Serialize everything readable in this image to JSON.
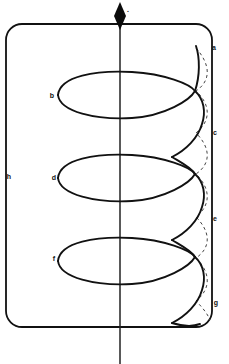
{
  "figure": {
    "background_color": "#ffffff",
    "line_color": "#111111",
    "dashed_line_color": "#444444",
    "canvas": {
      "width": 229,
      "height": 364
    }
  },
  "labels": {
    "a": "a",
    "b": "b",
    "c": "c",
    "d": "d",
    "e": "e",
    "f": "f",
    "g": "g",
    "h": "h",
    "apex": "."
  },
  "label_positions": {
    "a": {
      "x": 214,
      "y": 48
    },
    "b": {
      "x": 52,
      "y": 96
    },
    "c": {
      "x": 215,
      "y": 133
    },
    "d": {
      "x": 54,
      "y": 178
    },
    "e": {
      "x": 215,
      "y": 219
    },
    "f": {
      "x": 54,
      "y": 259
    },
    "g": {
      "x": 216,
      "y": 303
    },
    "h": {
      "x": 9,
      "y": 177
    },
    "apex": {
      "x": 128,
      "y": 10
    }
  },
  "geometry": {
    "outer_rect": {
      "x": 6,
      "y": 24,
      "width": 206,
      "height": 303,
      "radius": 16
    },
    "axis": {
      "x": 120,
      "y_top": 14,
      "y_bottom": 364
    },
    "marker": {
      "type": "filled-diamond",
      "cx": 120,
      "cy": 14,
      "rx": 6,
      "ry": 11
    },
    "coils": [
      {
        "top_y": 72,
        "bottom_y": 118,
        "left_x": 58,
        "cross_x": 195
      },
      {
        "top_y": 155,
        "bottom_y": 201,
        "left_x": 58,
        "cross_x": 195
      },
      {
        "top_y": 238,
        "bottom_y": 284,
        "left_x": 58,
        "cross_x": 195
      }
    ],
    "dashed_arc": {
      "x_min": 196,
      "x_max": 212
    }
  }
}
